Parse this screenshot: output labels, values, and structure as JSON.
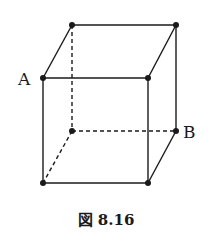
{
  "figure": {
    "caption": "図 8.16",
    "labels": {
      "A": "A",
      "B": "B"
    },
    "vertices": {
      "top_back_left": [
        72,
        25
      ],
      "top_back_right": [
        176,
        25
      ],
      "top_front_left": [
        43,
        78
      ],
      "top_front_right": [
        148,
        78
      ],
      "bottom_back_left": [
        72,
        131
      ],
      "bottom_back_right": [
        176,
        131
      ],
      "bottom_front_left": [
        43,
        183
      ],
      "bottom_front_right": [
        148,
        183
      ]
    },
    "hidden_edges": [
      "top_back_left-bottom_back_left",
      "bottom_back_left-bottom_back_right",
      "bottom_back_left-bottom_front_left"
    ],
    "stroke_color": "#1a1a1a"
  }
}
